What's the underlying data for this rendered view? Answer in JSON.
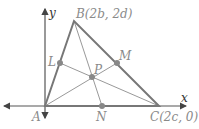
{
  "diagram": {
    "axes": {
      "x_label": "x",
      "y_label": "y"
    },
    "points": {
      "A": {
        "label": "A"
      },
      "B": {
        "label": "B(2b, 2d)"
      },
      "C": {
        "label": "C(2c, 0)"
      },
      "L": {
        "label": "L"
      },
      "M": {
        "label": "M"
      },
      "N": {
        "label": "N"
      },
      "P": {
        "label": "P"
      }
    },
    "colors": {
      "triangle": "#777777",
      "medians": "#999999",
      "axes": "#555555",
      "points": "#888888",
      "labels": "#8a8a8a"
    }
  }
}
